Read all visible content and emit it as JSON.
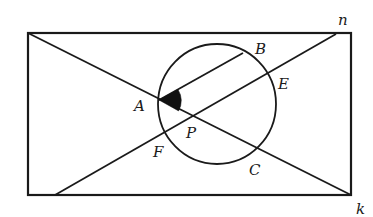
{
  "diagram": {
    "colors": {
      "line": "#1a1a1a",
      "background": "#ffffff",
      "angle_fill": "#111111"
    },
    "rectangle": {
      "x1": 28,
      "y1": 33,
      "x2": 351,
      "y2": 195
    },
    "lines": [
      {
        "name": "diagonal-ak",
        "from": [
          28,
          33
        ],
        "to": [
          351,
          195
        ]
      },
      {
        "name": "line-fe",
        "from": [
          55,
          195
        ],
        "to": [
          336,
          34
        ]
      },
      {
        "name": "segment-ab",
        "from": [
          159,
          100
        ],
        "to": [
          243,
          53
        ]
      }
    ],
    "circle": {
      "cx": 217,
      "cy": 104,
      "rx": 59,
      "ry": 60
    },
    "angle_marker": {
      "vertex": "A",
      "between": [
        "AB",
        "AP"
      ]
    },
    "labels": {
      "A": "A",
      "B": "B",
      "C": "C",
      "E": "E",
      "F": "F",
      "P": "P",
      "n": "n",
      "k": "k"
    }
  }
}
